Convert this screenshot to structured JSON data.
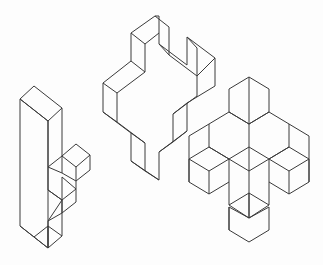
{
  "document": {
    "title": "Isometric Polycube Figures",
    "kind": "line-art-diagram",
    "background_color": "#fdfdfd",
    "stroke_color": "#3a3a3a",
    "stroke_width": 1,
    "canvas": {
      "width": 323,
      "height": 265
    },
    "figure_count": 3,
    "projection": "isometric",
    "description": "Three isometric wireframe polycube cross/plus shapes arranged left to right with increasing three-dimensional complexity."
  },
  "figures": [
    {
      "id": "figure-left",
      "name": "left-plus-prism",
      "label": "Left figure — thin plus-shaped prism",
      "bbox": {
        "x": 18,
        "y": 84,
        "width": 72,
        "height": 166
      },
      "paths": [
        "M 20 99 L 20 226 L 48 248 L 48 221 L 48 121 L 20 99 Z",
        "M 20 99 L 34 86 L 62 108 L 48 121 L 20 99 Z",
        "M 48 248 L 62 236 L 62 213 L 62 200 L 48 221 Z",
        "M 62 108 L 62 156 L 48 167 L 48 121",
        "M 48 167 L 48 190 L 62 200 L 62 177",
        "M 62 156 L 76 144 L 90 155 L 90 170 L 76 181 L 62 173",
        "M 62 156 L 76 167 L 76 181",
        "M 76 167 L 90 155",
        "M 48 167 L 62 173 L 62 156",
        "M 48 190 L 62 200 L 76 189 L 76 181",
        "M 62 177 L 76 189",
        "M 62 213 L 76 202 L 76 189",
        "M 62 200 L 62 213",
        "M 48 221 L 62 213",
        "M 48 226 L 34 237 L 48 248",
        "M 20 226 L 34 237",
        "M 48 226 L 48 248",
        "M 62 236 L 48 226"
      ]
    },
    {
      "id": "figure-middle",
      "name": "middle-plus-prism",
      "label": "Middle figure — larger plus-shaped prism",
      "bbox": {
        "x": 96,
        "y": 15,
        "width": 120,
        "height": 165
      },
      "paths": [
        "M 155 16 L 131 33 L 131 61 L 103 83 L 103 112 L 131 133 L 131 161 L 159 180 L 159 152 L 187 131 L 187 103 L 215 86 L 215 58 L 187 37 L 187 65 L 159 44 L 159 16 Z",
        "M 155 16 L 169 27 L 169 55 L 197 76 L 197 48 L 187 37",
        "M 169 55 L 159 44",
        "M 197 76 L 215 58",
        "M 197 76 L 197 96 L 173 114 L 173 142 L 159 152",
        "M 173 114 L 187 103",
        "M 173 142 L 187 131",
        "M 131 33 L 145 44 L 145 72 L 117 93 L 117 122 L 145 143 L 145 171 L 159 180",
        "M 145 44 L 159 33",
        "M 117 93 L 103 83",
        "M 117 122 L 103 112",
        "M 145 171 L 131 161",
        "M 145 143 L 131 133",
        "M 145 72 L 131 61"
      ]
    },
    {
      "id": "figure-right",
      "name": "right-3d-cross",
      "label": "Right figure — full three-dimensional cross of cubes",
      "bbox": {
        "x": 186,
        "y": 76,
        "width": 124,
        "height": 168
      },
      "paths": [
        "M 249 77 L 229 89 L 229 112 L 249 124 L 269 112 L 269 89 Z",
        "M 249 77 L 249 124",
        "M 229 112 L 209 124 L 209 147 L 229 159 L 249 147 L 249 124",
        "M 269 112 L 289 124 L 289 147 L 269 159 L 249 147",
        "M 209 124 L 189 136 L 189 159 L 209 171 L 229 159",
        "M 289 124 L 309 136 L 309 159 L 289 171 L 269 159",
        "M 209 147 L 229 159 L 229 182 L 209 194 L 189 182 L 189 159",
        "M 289 147 L 269 159 L 269 182 L 289 194 L 309 182 L 309 159",
        "M 229 159 L 249 171 L 269 159",
        "M 249 147 L 249 171",
        "M 249 171 L 249 218",
        "M 229 182 L 229 205 L 249 218 L 269 205 L 269 182",
        "M 229 205 L 249 193 L 269 205",
        "M 249 193 L 249 218",
        "M 209 171 L 209 194",
        "M 289 171 L 289 194",
        "M 189 159 L 189 182",
        "M 309 159 L 309 182",
        "M 229 112 L 249 124 L 269 112",
        "M 209 147 L 189 159",
        "M 289 147 L 309 159",
        "M 229 230 L 249 242 L 269 230 L 269 207 L 249 218 L 229 207 Z",
        "M 229 207 L 229 230"
      ]
    }
  ]
}
